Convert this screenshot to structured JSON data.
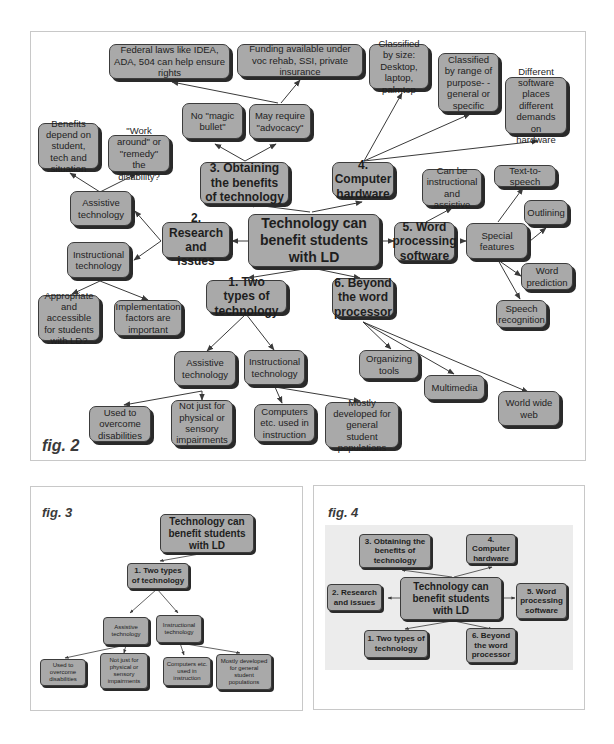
{
  "fig2": {
    "label": "fig. 2",
    "root": "Technology can benefit students with LD",
    "topics": {
      "t1": "1. Two types of technology",
      "t2": "2. Research and issues",
      "t3": "3. Obtaining the benefits of technology",
      "t4": "4. Computer hardware",
      "t5": "5. Word processing software",
      "t6": "6. Beyond the word processor"
    },
    "t1_children": {
      "assistive": "Assistive technology",
      "instructional": "Instructional technology",
      "used_to_overcome": "Used to overcome disabilities",
      "not_just_physical": "Not just for physical or sensory impairments",
      "computers_etc": "Computers etc. used in instruction",
      "mostly_developed": "Mostly developed for general student populations"
    },
    "t2_children": {
      "assistive": "Assistive technology",
      "instructional": "Instructional technology",
      "benefits_depend": "Benefits depend on student, tech and situation",
      "work_around": "\"Work around\" or \"remedy\" the disability?",
      "appropriate": "Appropriate and accessible for students with LD?",
      "implementation": "Implementation factors are important"
    },
    "t3_children": {
      "no_magic": "No \"magic bullet\"",
      "advocacy": "May require \"advocacy\"",
      "federal_laws": "Federal laws like IDEA, ADA, 504 can help ensure rights",
      "funding": "Funding available under voc rehab, SSI, private insurance"
    },
    "t4_children": {
      "by_size": "Classified by size: Desktop, laptop, palmtop",
      "by_purpose": "Classified by range of purpose- -general or specific",
      "demands": "Different software places different demands on hardware"
    },
    "t5_children": {
      "instr_assistive": "Can be instructional and assistive",
      "special_features": "Special features",
      "tts": "Text-to-speech",
      "outlining": "Outlining",
      "word_prediction": "Word prediction",
      "speech_recognition": "Speech recognition"
    },
    "t6_children": {
      "organizing": "Organizing tools",
      "multimedia": "Multimedia",
      "www": "World wide web"
    }
  },
  "fig3": {
    "label": "fig. 3",
    "root": "Technology can benefit students with LD",
    "t1": "1. Two types of technology",
    "assistive": "Assistive technology",
    "instructional": "Instructional technology",
    "used_to_overcome": "Used to overcome disabilities",
    "not_just_physical": "Not just for physical or sensory impairments",
    "computers_etc": "Computers etc. used in instruction",
    "mostly_developed": "Mostly developed for general student populations"
  },
  "fig4": {
    "label": "fig. 4",
    "root": "Technology can benefit students with LD",
    "t1": "1. Two types of technology",
    "t2": "2. Research and issues",
    "t3": "3. Obtaining the benefits of technology",
    "t4": "4. Computer hardware",
    "t5": "5. Word processing software",
    "t6": "6. Beyond the word processor"
  },
  "colors": {
    "node_fill": "#a9a9a9",
    "node_border": "#3c3c3c",
    "shadow": "#2a2a2a",
    "edge": "#3a3a3a",
    "panel_border": "#c8c8c8"
  }
}
